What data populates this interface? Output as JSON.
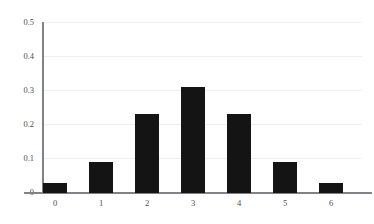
{
  "chart_data": {
    "type": "bar",
    "title": "",
    "subtitle": "",
    "xlabel": "",
    "ylabel": "",
    "categories": [
      "0",
      "1",
      "2",
      "3",
      "4",
      "5",
      "6"
    ],
    "values": [
      0.03,
      0.09,
      0.23,
      0.31,
      0.23,
      0.09,
      0.03
    ],
    "series": [
      {
        "name": "probability",
        "values": [
          0.03,
          0.09,
          0.23,
          0.31,
          0.23,
          0.09,
          0.03
        ]
      }
    ],
    "xlim": [
      -0.6,
      6.6
    ],
    "ylim": [
      0,
      0.53
    ],
    "yticks": [
      0,
      0.1,
      0.2,
      0.3,
      0.4,
      0.5
    ],
    "ytick_labels": [
      "0",
      "0.1",
      "0.2",
      "0.3",
      "0.4",
      "0.5"
    ],
    "xticks": [
      0,
      1,
      2,
      3,
      4,
      5,
      6
    ],
    "xtick_labels": [
      "0",
      "1",
      "2",
      "3",
      "4",
      "5",
      "6"
    ],
    "grid": true,
    "grid_axis": "y",
    "legend": false,
    "legend_position": "none",
    "annotations": [],
    "colors": {
      "bar": "#141414",
      "gridline": "#f0eff0",
      "axis": "#808285",
      "tick_label": "#4d4d4f",
      "background": "#ffffff"
    }
  }
}
